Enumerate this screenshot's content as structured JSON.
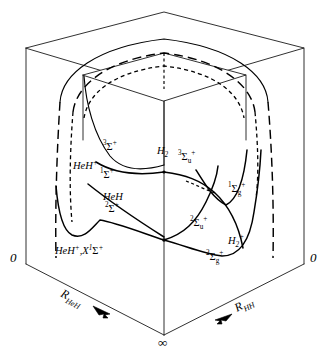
{
  "figure": {
    "name": "potential-energy-surface-diagram",
    "background_color": "#ffffff",
    "line_color": "#000000"
  },
  "axes": {
    "left_axis": {
      "label": "R",
      "subscript": "HeH",
      "origin_label": "0",
      "arrow": "down-right-arrow"
    },
    "right_axis": {
      "label": "R",
      "subscript": "HH",
      "origin_label": "0",
      "arrow": "down-left-arrow"
    },
    "front_vertical": {
      "bottom_label": "∞"
    }
  },
  "curve_labels": [
    {
      "id": "triplet-sigma-plus",
      "base": "",
      "superscript_left": "3",
      "symbol": "Σ",
      "superscript_right": "+",
      "subscript_right": "",
      "x": 113,
      "y": 148,
      "text": "3Σ+"
    },
    {
      "id": "heh-plus-singlet-sigma-plus",
      "base": "HeH",
      "base_sup": "+",
      "superscript_left": "1",
      "symbol": "Σ",
      "superscript_right": "+",
      "subscript_right": "",
      "x": 88,
      "y": 171,
      "text": "HeH+ 1Σ+"
    },
    {
      "id": "h2-triplet-sigma-u-plus",
      "base": "H",
      "base_sub": "2",
      "superscript_left": "3",
      "symbol": "Σ",
      "superscript_right": "+",
      "subscript_right": "u",
      "x": 158,
      "y": 152,
      "text": "H2 3Σu+"
    },
    {
      "id": "heh-doublet-sigma-plus",
      "base": "HeH",
      "superscript_left": "2",
      "symbol": "Σ",
      "superscript_right": "+",
      "subscript_right": "",
      "x": 110,
      "y": 203,
      "text": "HeH 2Σ+"
    },
    {
      "id": "singlet-sigma-g-plus",
      "base": "",
      "superscript_left": "1",
      "symbol": "Σ",
      "superscript_right": "+",
      "subscript_right": "g",
      "x": 235,
      "y": 190,
      "text": "1Σg+"
    },
    {
      "id": "doublet-sigma-u-plus",
      "base": "",
      "superscript_left": "2",
      "symbol": "Σ",
      "superscript_right": "+",
      "subscript_right": "u",
      "x": 197,
      "y": 225,
      "text": "2Σu+"
    },
    {
      "id": "h2-plus",
      "base": "H",
      "base_sub": "2",
      "base_sup": "+",
      "symbol": "",
      "x": 233,
      "y": 240,
      "text": "H2+"
    },
    {
      "id": "doublet-sigma-g-plus",
      "base": "",
      "superscript_left": "2",
      "symbol": "Σ",
      "superscript_right": "+",
      "subscript_right": "g",
      "x": 213,
      "y": 258,
      "text": "2Σg+"
    },
    {
      "id": "heh-plus-ground-state",
      "base": "HeH",
      "base_sup": "+",
      "comma": ",",
      "term": "X",
      "superscript_left": "1",
      "symbol": "Σ",
      "superscript_right": "+",
      "x": 62,
      "y": 250,
      "text": "HeH+, X1Σ+"
    }
  ],
  "label_text": {
    "three": "3",
    "two": "2",
    "one": "1",
    "plus": "+",
    "sigma": "Σ",
    "sub_u": "u",
    "sub_g": "g",
    "sub_2": "2",
    "HeH": "HeH",
    "H": "H",
    "X": "X",
    "comma": ",",
    "zero": "0",
    "infinity": "∞",
    "R": "R",
    "sub_HeH": "HeH",
    "sub_HH": "HH"
  }
}
